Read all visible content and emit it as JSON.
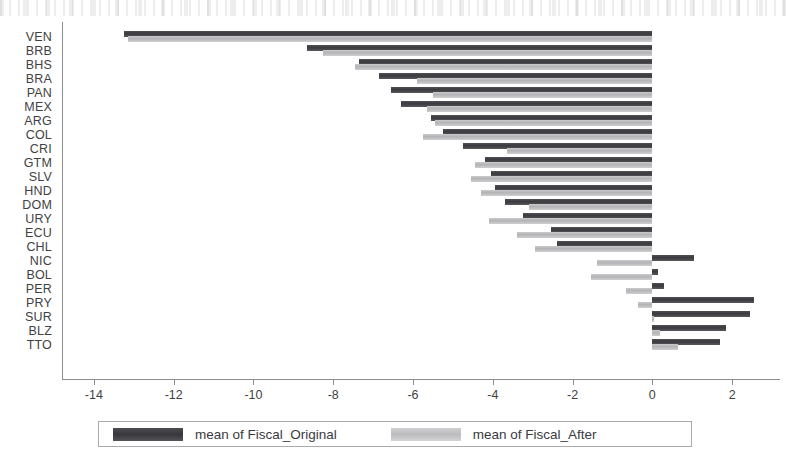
{
  "chart_data": {
    "type": "bar",
    "orientation": "horizontal",
    "title": "",
    "subtitle": "",
    "xlabel": "",
    "ylabel": "",
    "xlim": [
      -14.8,
      3.2
    ],
    "xticks": [
      -14,
      -12,
      -10,
      -8,
      -6,
      -4,
      -2,
      0,
      2
    ],
    "xticklabels": [
      "-14",
      "-12",
      "-10",
      "-8",
      "-6",
      "-4",
      "-2",
      "0",
      "2"
    ],
    "grid": false,
    "legend_position": "bottom",
    "categories": [
      "VEN",
      "BRB",
      "BHS",
      "BRA",
      "PAN",
      "MEX",
      "ARG",
      "COL",
      "CRI",
      "GTM",
      "SLV",
      "HND",
      "DOM",
      "URY",
      "ECU",
      "CHL",
      "NIC",
      "BOL",
      "PER",
      "PRY",
      "SUR",
      "BLZ",
      "TTO"
    ],
    "series": [
      {
        "name": "mean of Fiscal_Original",
        "color": "#3b3b3f",
        "values": [
          -13.25,
          -8.65,
          -7.35,
          -6.85,
          -6.55,
          -6.3,
          -5.55,
          -5.25,
          -4.75,
          -4.2,
          -4.05,
          -3.95,
          -3.7,
          -3.25,
          -2.55,
          -2.4,
          1.05,
          0.15,
          0.3,
          2.55,
          2.45,
          1.85,
          1.7
        ]
      },
      {
        "name": "mean of Fiscal_After",
        "color": "#b4b4b7",
        "values": [
          -13.15,
          -8.25,
          -7.45,
          -5.9,
          -5.5,
          -5.65,
          -5.45,
          -5.75,
          -3.65,
          -4.45,
          -4.55,
          -4.3,
          -3.1,
          -4.1,
          -3.4,
          -2.95,
          -1.4,
          -1.55,
          -0.65,
          -0.35,
          0.05,
          0.2,
          0.65
        ]
      }
    ]
  },
  "legend": {
    "entries": [
      {
        "label": "mean of Fiscal_Original",
        "swatch": "orig"
      },
      {
        "label": "mean of Fiscal_After",
        "swatch": "after"
      }
    ]
  },
  "icons": {
    "axis_left": "vertical-axis-line",
    "axis_bottom": "horizontal-axis-line"
  }
}
